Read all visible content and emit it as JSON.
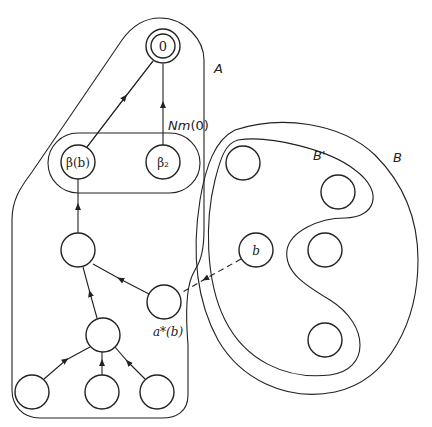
{
  "diagram": {
    "regions": {
      "A": {
        "label": "A"
      },
      "Nm0": {
        "label": "Nm(0)"
      },
      "B": {
        "label": "B"
      },
      "Bprime": {
        "label": "B'"
      }
    },
    "nodes": {
      "root": {
        "label": "0"
      },
      "beta_b": {
        "label": "β(b)"
      },
      "beta_2": {
        "label": "β₂"
      },
      "b": {
        "label": "b"
      },
      "a_star_b": {
        "label": "a*(b)"
      }
    },
    "edges": [
      {
        "from": "beta_b",
        "to": "root",
        "style": "solid"
      },
      {
        "from": "beta_2",
        "to": "root",
        "style": "solid"
      },
      {
        "from": "mid",
        "to": "beta_b",
        "style": "solid"
      },
      {
        "from": "a_star_b",
        "to": "mid",
        "style": "solid"
      },
      {
        "from": "low",
        "to": "mid",
        "style": "solid"
      },
      {
        "from": "leaf1",
        "to": "low",
        "style": "solid"
      },
      {
        "from": "leaf2",
        "to": "low",
        "style": "solid"
      },
      {
        "from": "leaf3",
        "to": "low",
        "style": "solid"
      },
      {
        "from": "b",
        "to": "a_star_b",
        "style": "dashed"
      }
    ]
  }
}
